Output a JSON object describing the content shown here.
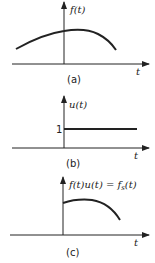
{
  "panels": [
    {
      "id": "a",
      "ylabel": "f(t)",
      "xlabel": "t",
      "caption": "(a)",
      "description": "smooth signal f(t) defined for all t, rising then falling"
    },
    {
      "id": "b",
      "ylabel": "u(t)",
      "xlabel": "t",
      "caption": "(b)",
      "tick_label": "1",
      "description": "unit step u(t), value 1 for t >= 0"
    },
    {
      "id": "c",
      "ylabel": "f(t)u(t) = f",
      "ylabel_sub": "s",
      "ylabel_end": "(t)",
      "xlabel": "t",
      "caption": "(c)",
      "description": "product f(t)u(t) = fs(t), zero for t < 0"
    }
  ],
  "colors": {
    "line": "#222222",
    "background": "#ffffff"
  }
}
